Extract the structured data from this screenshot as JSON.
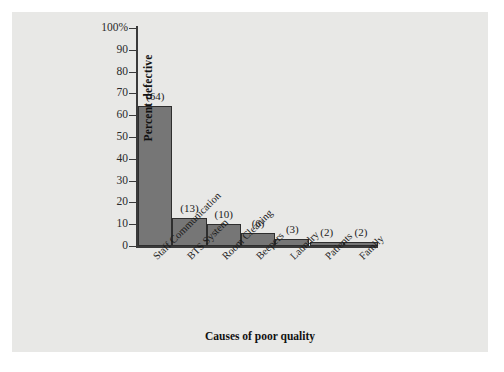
{
  "figure": {
    "background_color": "#ffffff",
    "plate_color": "#e8e8e6"
  },
  "chart_data": {
    "type": "bar",
    "title": "",
    "subtitle": "",
    "xlabel": "Causes of poor quality",
    "ylabel": "Percent defective",
    "categories": [
      "Staff Communication",
      "BTS System",
      "Room Cleaning",
      "Beepers",
      "Laundry",
      "Patients",
      "Family"
    ],
    "values": [
      64,
      13,
      10,
      6,
      3,
      2,
      2
    ],
    "data_labels": [
      "(64)",
      "(13)",
      "(10)",
      "(6)",
      "(3)",
      "(2)",
      "(2)"
    ],
    "ylim": [
      0,
      100
    ],
    "ytick_labels": [
      "100%",
      "90",
      "80",
      "70",
      "60",
      "50",
      "40",
      "30",
      "20",
      "10",
      "0"
    ],
    "ytick_values": [
      100,
      90,
      80,
      70,
      60,
      50,
      40,
      30,
      20,
      10,
      0
    ],
    "grid": false,
    "legend": null,
    "bar_color": "#767676",
    "bar_edge_color": "#2e2e2e",
    "axis_color": "#3a3a3a",
    "text_color": "#1c1c1c"
  }
}
